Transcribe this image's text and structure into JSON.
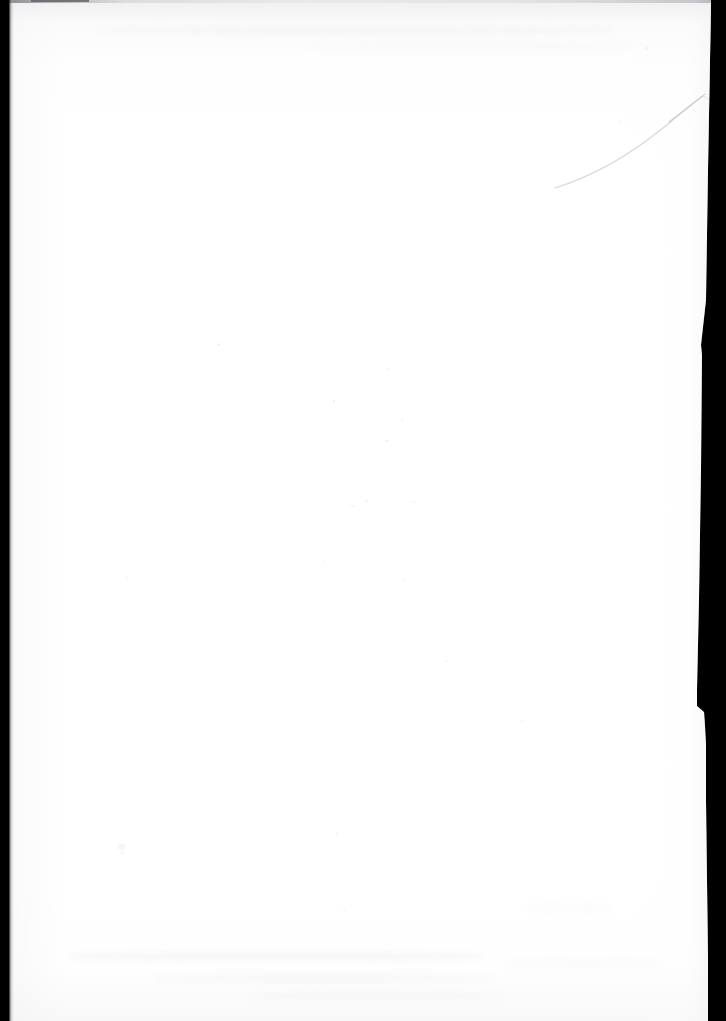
{
  "document": {
    "kind": "scanned-page",
    "page_label": "",
    "page_content_text": "",
    "is_blank": true,
    "caption": "Blank scanned page"
  },
  "scan": {
    "width_px": 726,
    "height_px": 1021,
    "backdrop_color": "#000000",
    "paper_color": "#ffffff",
    "paper_tint_color": "#f7f7f8",
    "edge_shadow_color": "#5a5a5f"
  },
  "artifacts": {
    "top_edge_line_label": "top-edge-line",
    "left_gutter_label": "left-gutter-shadow",
    "right_edge_label": "right-edge-fringe",
    "crease_label": "diagonal-crease",
    "notch_label": "edge-notch",
    "speckle_label": "scanner-speckle",
    "smudge_label": "scanner-smudge"
  }
}
